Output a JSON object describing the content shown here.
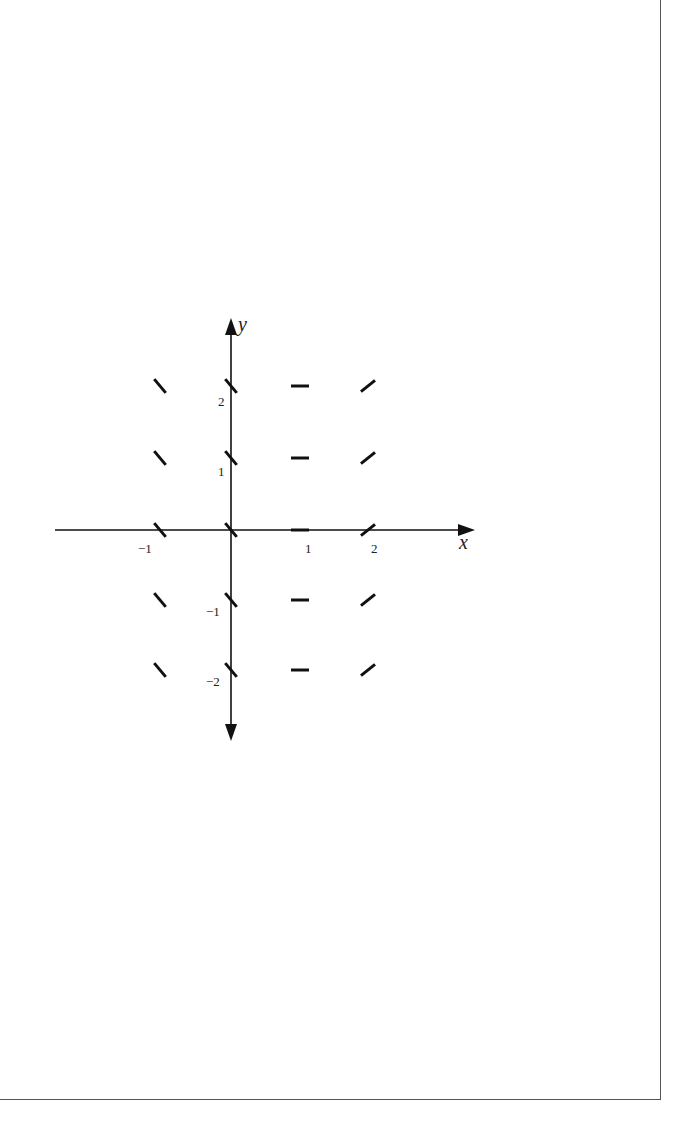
{
  "chart_data": {
    "type": "slope_field",
    "title": "",
    "xlabel": "x",
    "ylabel": "y",
    "x_ticks": [
      -1,
      1,
      2
    ],
    "y_ticks": [
      -2,
      -1,
      1,
      2
    ],
    "x_tick_labels": [
      "−1",
      "1",
      "2"
    ],
    "y_tick_labels": [
      "−2",
      "−1",
      "1",
      "2"
    ],
    "grid": false,
    "x_points": [
      -1,
      0,
      1,
      2
    ],
    "y_points": [
      -2,
      -1,
      0,
      1,
      2
    ],
    "slopes_by_x": {
      "-1": -1.2,
      "0": -1.2,
      "1": 0,
      "2": 0.8
    }
  },
  "axes": {
    "x_label": "x",
    "y_label": "y"
  }
}
